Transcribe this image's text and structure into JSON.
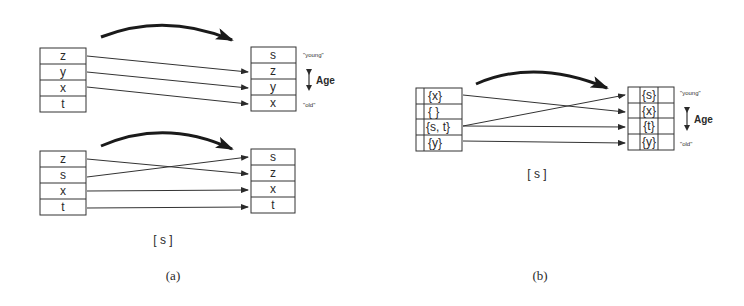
{
  "figure": {
    "panel_a": {
      "label": "(a)",
      "caption": "[ s ]",
      "top": {
        "left_stack": [
          "z",
          "y",
          "x",
          "t"
        ],
        "right_stack": [
          "s",
          "z",
          "y",
          "x"
        ],
        "age_labels": {
          "young": "\"young\"",
          "old": "\"old\"",
          "axis": "Age"
        }
      },
      "bottom": {
        "left_stack": [
          "z",
          "s",
          "x",
          "t"
        ],
        "right_stack": [
          "s",
          "z",
          "x",
          "t"
        ]
      }
    },
    "panel_b": {
      "label": "(b)",
      "caption": "[ s ]",
      "left_stack": [
        "{x}",
        "{ }",
        "{s, t}",
        "{y}"
      ],
      "right_stack": [
        "{s}",
        "{x}",
        "{t}",
        "{y}"
      ],
      "age_labels": {
        "young": "\"young\"",
        "old": "\"old\"",
        "axis": "Age"
      }
    }
  }
}
